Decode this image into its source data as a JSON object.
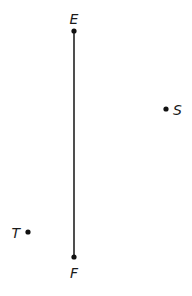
{
  "diagram": {
    "segment": {
      "from": "E",
      "to": "F",
      "color": "#222222"
    },
    "points": [
      {
        "id": "E",
        "label": "E",
        "x": 74,
        "y": 31,
        "lx": 74,
        "ly": 24,
        "anchor": "middle"
      },
      {
        "id": "F",
        "label": "F",
        "x": 74,
        "y": 257,
        "lx": 74,
        "ly": 278,
        "anchor": "middle"
      },
      {
        "id": "S",
        "label": "S",
        "x": 166,
        "y": 109,
        "lx": 173,
        "ly": 115,
        "anchor": "start"
      },
      {
        "id": "T",
        "label": "T",
        "x": 28,
        "y": 232,
        "lx": 20,
        "ly": 238,
        "anchor": "end"
      }
    ]
  }
}
